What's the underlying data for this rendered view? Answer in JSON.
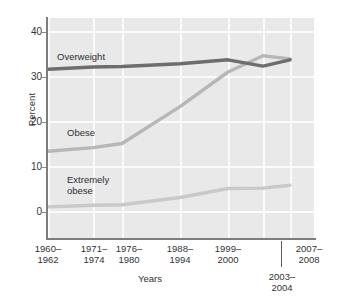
{
  "chart_data": {
    "type": "line",
    "title": "",
    "xlabel": "Years",
    "ylabel": "Percent",
    "ylim": [
      0,
      44
    ],
    "yticks": [
      0,
      10,
      20,
      30,
      40
    ],
    "grid": true,
    "legend_position": "inline-annotations",
    "categories": [
      "1960–1962",
      "1971–1974",
      "1976–1980",
      "1988–1994",
      "1999–2000",
      "2003–2004",
      "2007–2008"
    ],
    "series": [
      {
        "name": "Overweight",
        "color": "#6d6d6d",
        "values": [
          31.5,
          32.0,
          32.1,
          32.7,
          33.6,
          32.2,
          33.6
        ]
      },
      {
        "name": "Obese",
        "color": "#b7b7b7",
        "values": [
          13.3,
          14.1,
          15.0,
          23.2,
          30.9,
          34.5,
          33.8
        ]
      },
      {
        "name": "Extremely obese",
        "color": "#c9c9c9",
        "values": [
          0.9,
          1.3,
          1.4,
          3.0,
          5.0,
          5.1,
          5.7
        ]
      }
    ],
    "annotations": [
      {
        "text": "Overweight",
        "x_category": "1960–1962",
        "y": 34.5
      },
      {
        "text": "Obese",
        "x_category": "1960–1962",
        "y": 17.0
      },
      {
        "text": "Extremely obese",
        "x_category": "1960–1962",
        "y": 4.6
      }
    ]
  },
  "axes": {
    "y_title": "Percent",
    "x_title": "Years",
    "y_tick_labels": [
      "40",
      "30",
      "20",
      "10",
      "0"
    ],
    "x_tick_labels": [
      {
        "line1": "1960–",
        "line2": "1962"
      },
      {
        "line1": "1971–",
        "line2": "1974"
      },
      {
        "line1": "1976–",
        "line2": "1980"
      },
      {
        "line1": "1988–",
        "line2": "1994"
      },
      {
        "line1": "1999–",
        "line2": "2000"
      },
      {
        "line1": "2007–",
        "line2": "2008"
      }
    ],
    "x_tick_label_below": {
      "line1": "2003–",
      "line2": "2004"
    }
  },
  "inline_labels": {
    "overweight": "Overweight",
    "obese": "Obese",
    "extremely_obese_line1": "Extremely",
    "extremely_obese_line2": "obese"
  },
  "colors": {
    "plot_background": "#e9e9e9",
    "gridline": "#fbfbfb",
    "axis": "#7d7d7d",
    "overweight": "#6d6d6d",
    "obese": "#b7b7b7",
    "extremely_obese": "#c9c9c9",
    "text": "#333333"
  }
}
